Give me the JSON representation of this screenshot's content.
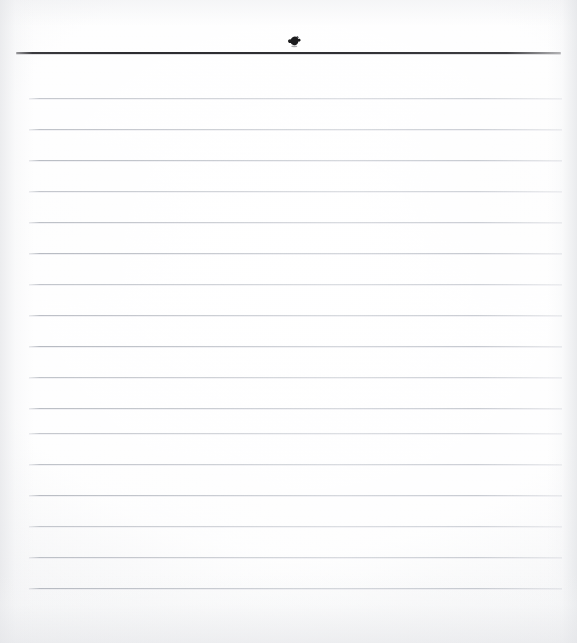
{
  "page": {
    "kind": "scanned-blank-ruled-paper",
    "width": 577,
    "height": 643,
    "background_color": "#fcfcfd",
    "content_text": ""
  },
  "header_rule": {
    "color": "#303034",
    "left": 16,
    "top": 52,
    "width": 545,
    "thickness": 2
  },
  "ink_mark": {
    "name": "ink-smudge",
    "color": "#1d1d1f",
    "left": 287,
    "top": 35,
    "width": 15,
    "height": 13
  },
  "ruled_lines": {
    "color": "#b6bac2",
    "count": 17,
    "left": 29,
    "right_edge": 562,
    "width": 533,
    "first_y": 98,
    "spacing": 31,
    "positions": [
      98,
      129,
      160,
      191,
      222,
      253,
      284,
      315,
      346,
      377,
      408,
      433,
      464,
      495,
      526,
      557,
      588
    ]
  }
}
